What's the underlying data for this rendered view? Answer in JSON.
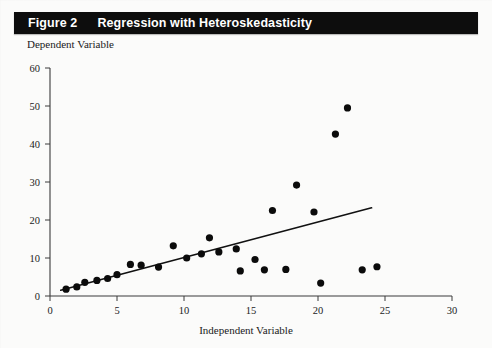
{
  "figure": {
    "number_label": "Figure 2",
    "title": "Regression with Heteroskedasticity"
  },
  "colors": {
    "title_bar_background": "#0d0d0d",
    "title_text": "#ffffff",
    "page_background": "#fbfbfa",
    "point_fill": "#0b0b0b",
    "line_stroke": "#111111",
    "axis_stroke": "#3a3a3a"
  },
  "chart_data": {
    "type": "scatter",
    "title": "Regression with Heteroskedasticity",
    "xlabel": "Independent Variable",
    "ylabel": "Dependent Variable",
    "xlim": [
      0,
      30
    ],
    "ylim": [
      0,
      60
    ],
    "xticks": [
      0,
      5,
      10,
      15,
      20,
      25,
      30
    ],
    "yticks": [
      0,
      10,
      20,
      30,
      40,
      50,
      60
    ],
    "xtick_labels": [
      "0",
      "5",
      "10",
      "15",
      "20",
      "25",
      "30"
    ],
    "ytick_labels": [
      "0",
      "10",
      "20",
      "30",
      "40",
      "50",
      "60"
    ],
    "grid": false,
    "legend": false,
    "series": [
      {
        "name": "Observations",
        "type": "scatter",
        "marker": "filled-circle",
        "points": [
          {
            "x": 1.2,
            "y": 1.8
          },
          {
            "x": 2.0,
            "y": 2.4
          },
          {
            "x": 2.6,
            "y": 3.6
          },
          {
            "x": 3.5,
            "y": 4.1
          },
          {
            "x": 4.3,
            "y": 4.6
          },
          {
            "x": 5.0,
            "y": 5.6
          },
          {
            "x": 6.0,
            "y": 8.3
          },
          {
            "x": 6.8,
            "y": 8.1
          },
          {
            "x": 8.1,
            "y": 7.6
          },
          {
            "x": 9.2,
            "y": 13.2
          },
          {
            "x": 10.2,
            "y": 10.0
          },
          {
            "x": 11.3,
            "y": 11.1
          },
          {
            "x": 11.9,
            "y": 15.3
          },
          {
            "x": 12.6,
            "y": 11.6
          },
          {
            "x": 13.9,
            "y": 12.4
          },
          {
            "x": 14.2,
            "y": 6.6
          },
          {
            "x": 15.3,
            "y": 9.6
          },
          {
            "x": 16.0,
            "y": 6.9
          },
          {
            "x": 16.6,
            "y": 22.5
          },
          {
            "x": 17.6,
            "y": 7.0
          },
          {
            "x": 18.4,
            "y": 29.2
          },
          {
            "x": 19.7,
            "y": 22.1
          },
          {
            "x": 20.2,
            "y": 3.4
          },
          {
            "x": 21.3,
            "y": 42.6
          },
          {
            "x": 22.2,
            "y": 49.5
          },
          {
            "x": 23.3,
            "y": 6.9
          },
          {
            "x": 24.4,
            "y": 7.7
          }
        ]
      },
      {
        "name": "Fitted regression line",
        "type": "line",
        "x_start": 0.8,
        "y_start": 1.5,
        "x_end": 24.0,
        "y_end": 23.2
      }
    ]
  }
}
